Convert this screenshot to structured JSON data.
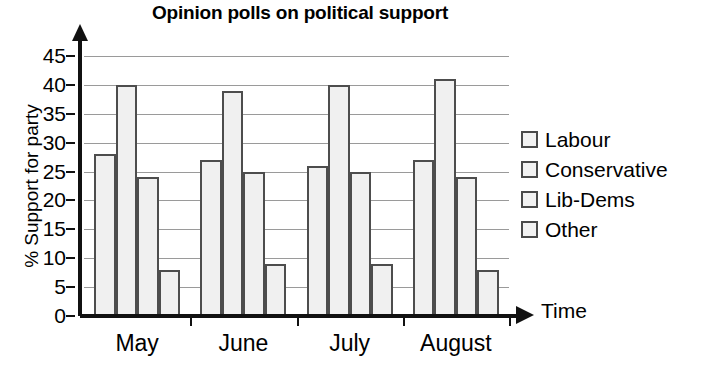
{
  "chart_data": {
    "type": "bar",
    "title": "Opinion polls on political support",
    "xlabel": "Time",
    "ylabel": "% Support for party",
    "categories": [
      "May",
      "June",
      "July",
      "August"
    ],
    "series": [
      {
        "name": "Labour",
        "values": [
          28,
          27,
          26,
          27
        ]
      },
      {
        "name": "Conservative",
        "values": [
          40,
          39,
          40,
          41
        ]
      },
      {
        "name": "Lib-Dems",
        "values": [
          24,
          25,
          25,
          24
        ]
      },
      {
        "name": "Other",
        "values": [
          8,
          9,
          9,
          8
        ]
      }
    ],
    "ylim": [
      0,
      45
    ],
    "ytick_labels": [
      "45",
      "40",
      "35",
      "30",
      "25",
      "20",
      "15",
      "10",
      "5",
      "0"
    ],
    "ytick_values": [
      45,
      40,
      35,
      30,
      25,
      20,
      15,
      10,
      5,
      0
    ],
    "grid": true,
    "legend_position": "right",
    "colors": {
      "bar_fill": "#f0f0f0",
      "bar_stroke": "#4d4d4d",
      "gridline": "#9a9a9a",
      "axis": "#111111",
      "text": "#000000"
    }
  },
  "legend": {
    "items": [
      {
        "label": "Labour"
      },
      {
        "label": "Conservative"
      },
      {
        "label": "Lib-Dems"
      },
      {
        "label": "Other"
      }
    ]
  }
}
